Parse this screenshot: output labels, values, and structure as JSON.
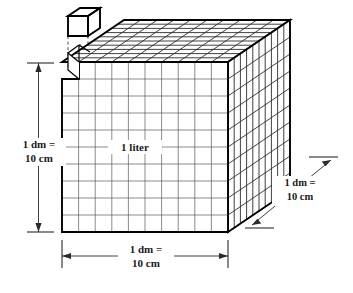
{
  "figure": {
    "title": "cubic-decimeter-liter-diagram",
    "description": "A cube divided into a 10 by 10 by 10 grid of unit cubes, with one unit cube lifted out above the top-left corner.",
    "background_color": "#ffffff",
    "line_color": "#000000",
    "grid_color": "#5a5a5a",
    "text_color": "#1a1a1a"
  },
  "labels": {
    "height": {
      "line1": "1 dm =",
      "line2": "10 cm"
    },
    "width": {
      "line1": "1 dm =",
      "line2": "10 cm"
    },
    "depth": {
      "line1": "1 dm =",
      "line2": "10 cm"
    },
    "volume": "1 liter"
  },
  "geometry": {
    "divisions": 10,
    "front_face": {
      "left": 62,
      "right": 228,
      "top": 62,
      "bottom": 232
    },
    "depth_offset": {
      "dx": 62,
      "dy": -42
    },
    "unit_cube": {
      "x": 68,
      "y": 14,
      "size": 20
    }
  }
}
